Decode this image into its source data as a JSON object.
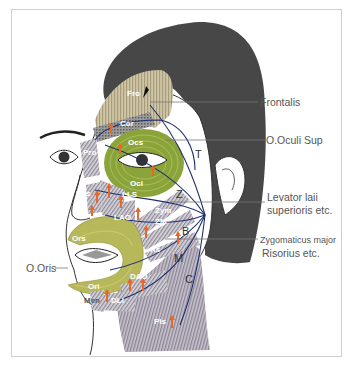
{
  "figure": {
    "callouts_right": [
      {
        "id": "frontalis",
        "label": "Frontalis"
      },
      {
        "id": "o-oculi-sup",
        "label": "O.Oculi Sup"
      },
      {
        "id": "levator",
        "label_line1": "Levator laii",
        "label_line2": "superioris etc."
      },
      {
        "id": "zygomaticus",
        "label_line1": "Zygomaticus major",
        "label_line2": "Risorius etc."
      }
    ],
    "callouts_left": [
      {
        "id": "o-oris",
        "label": "O.Oris"
      }
    ],
    "muscle_labels": {
      "fro": "Fro",
      "cor": "Cor",
      "pro": "Pro",
      "ocs": "Ocs",
      "oci": "Oci",
      "nas": "Nas",
      "lls": "LLS",
      "lao": "LAO",
      "zym": "Zym",
      "zm": "ZM",
      "ors": "Ors",
      "ori": "Ori",
      "rs": "Rs",
      "dao": "DAO",
      "dli": "DLI",
      "men": "Men",
      "pls": "Pls"
    },
    "nerve_branch_labels": {
      "temporal": "T",
      "zygomatic": "Z",
      "buccal": "B",
      "mandibular": "M",
      "cervical": "C"
    },
    "colors": {
      "hair": "#474747",
      "frontalis": "#b9ad8c",
      "orbicularis_oculi": "#8aa43a",
      "orbicularis_oris": "#b7b85a",
      "platysma": "#9a94a2",
      "nerve": "#1f2f6e",
      "arrow": "#e8682a",
      "outline": "#333333"
    }
  }
}
